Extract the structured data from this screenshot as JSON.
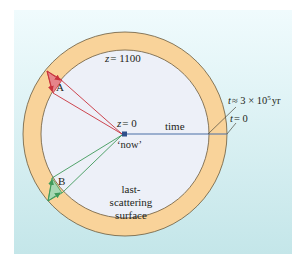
{
  "figure": {
    "colors": {
      "panel_top": "#eefafc",
      "panel_bottom": "#c7e8ea",
      "ring_fill": "#f9d39a",
      "ring_stroke": "#6b5a3c",
      "interior_fill": "#edf0f8",
      "ray_a": "#c8323c",
      "wedge_a": "#e6848a",
      "ray_b": "#3f9a5a",
      "wedge_b": "#a7d8b4",
      "time_line": "#4a6fa5",
      "leader": "#4d4a3f"
    },
    "labels": {
      "z_outer": "z = 1100",
      "z_outer_var": "z",
      "z_outer_val": "= 1100",
      "z_now_var": "z",
      "z_now_val": "= 0",
      "now": "‘now’",
      "time": "time",
      "t_recomb_var": "t",
      "t_recomb_approx": "≈ 3 × 10",
      "t_recomb_exp": "5",
      "t_recomb_unit": "yr",
      "t_zero_var": "t",
      "t_zero_val": "= 0",
      "point_a": "A",
      "point_b": "B",
      "surface_line1": "last-",
      "surface_line2": "scattering",
      "surface_line3": "surface"
    }
  }
}
